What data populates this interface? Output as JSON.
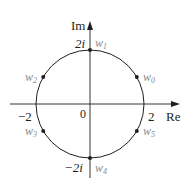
{
  "diagram": {
    "axes": {
      "real_label": "Re",
      "imag_label": "Im",
      "origin_label": "0"
    },
    "ticks": {
      "pos_real": "2",
      "neg_real": "−2",
      "pos_imag": "2i",
      "neg_imag": "−2i"
    },
    "points": [
      {
        "label": "w",
        "sub": "0",
        "angle_deg": 30
      },
      {
        "label": "w",
        "sub": "1",
        "angle_deg": 90
      },
      {
        "label": "w",
        "sub": "2",
        "angle_deg": 150
      },
      {
        "label": "w",
        "sub": "3",
        "angle_deg": 210
      },
      {
        "label": "w",
        "sub": "4",
        "angle_deg": 270
      },
      {
        "label": "w",
        "sub": "5",
        "angle_deg": 330
      }
    ],
    "circle_radius": 2,
    "colors": {
      "line": "#231f20",
      "point_label": "#8a8a8a"
    }
  }
}
